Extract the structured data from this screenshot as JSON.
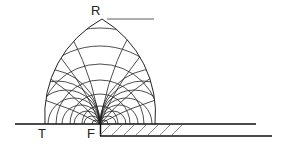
{
  "diagram": {
    "labels": {
      "top": "R",
      "left": "T",
      "corner": "F"
    },
    "mesh": {
      "left_family_count": 9,
      "right_family_count": 9
    },
    "colors": {
      "stroke": "#222222",
      "hatch": "#555555",
      "background": "#ffffff"
    }
  }
}
